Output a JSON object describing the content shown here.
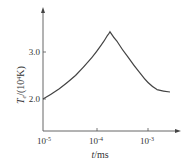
{
  "chart_data": {
    "type": "line",
    "title": "",
    "xlabel": "t/ms",
    "ylabel": "T_e/(10^4K)",
    "xscale": "log",
    "xlim": [
      1e-05,
      0.004
    ],
    "ylim": [
      1.6,
      4.0
    ],
    "x_ticks": [
      "10^-5",
      "10^-4",
      "10^-3"
    ],
    "y_ticks": [
      "2.0",
      "3.0"
    ],
    "grid": false,
    "legend": null,
    "series": [
      {
        "name": "T_e",
        "x": [
          1e-05,
          2e-05,
          4e-05,
          8e-05,
          0.00012,
          0.00016,
          0.00018,
          0.00025,
          0.0004,
          0.0007,
          0.001,
          0.0015,
          0.0027
        ],
        "y": [
          2.0,
          2.22,
          2.5,
          2.88,
          3.14,
          3.35,
          3.43,
          3.22,
          2.9,
          2.55,
          2.35,
          2.2,
          2.15
        ]
      }
    ]
  },
  "labels": {
    "x_axis": "t/ms",
    "y_axis_T": "T",
    "y_axis_sub": "e",
    "y_axis_rest": "/(10",
    "y_axis_sup": "4",
    "y_axis_unit": "K)",
    "y_tick_2": "2.0",
    "y_tick_3": "3.0",
    "x_tick_base": "10",
    "x_tick_exp_1": "-5",
    "x_tick_exp_2": "-4",
    "x_tick_exp_3": "-3"
  }
}
